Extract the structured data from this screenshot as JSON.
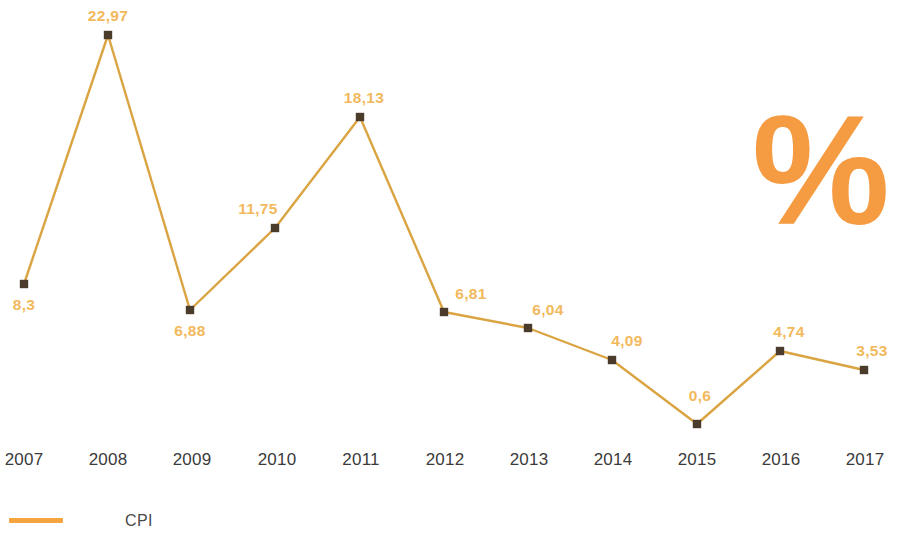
{
  "chart_data": {
    "type": "line",
    "title": "",
    "subtitle": "",
    "xlabel": "",
    "ylabel": "",
    "unit_symbol": "%",
    "grid": false,
    "legend_position": "bottom-left",
    "axis_line": false,
    "categories": [
      "2007",
      "2008",
      "2009",
      "2010",
      "2011",
      "2012",
      "2013",
      "2014",
      "2015",
      "2016",
      "2017"
    ],
    "values": [
      8.3,
      22.97,
      6.88,
      11.75,
      18.13,
      6.81,
      6.04,
      4.09,
      0.6,
      4.74,
      3.53
    ],
    "value_labels": [
      "8,3",
      "22,97",
      "6,88",
      "11,75",
      "18,13",
      "6,81",
      "6,04",
      "4,09",
      "0,6",
      "4,74",
      "3,53"
    ],
    "ylim": [
      0,
      24
    ],
    "series": [
      {
        "name": "CPI",
        "values": [
          8.3,
          22.97,
          6.88,
          11.75,
          18.13,
          6.81,
          6.04,
          4.09,
          0.6,
          4.74,
          3.53
        ],
        "color": "#D9A441"
      }
    ],
    "points": [
      {
        "year": "2007",
        "label": "8,3",
        "value": 8.3,
        "x": 24,
        "y": 284,
        "label_x": 24,
        "label_y": 297,
        "label_align": "center"
      },
      {
        "year": "2008",
        "label": "22,97",
        "value": 22.97,
        "x": 108,
        "y": 35,
        "label_x": 108,
        "label_y": 8,
        "label_align": "center"
      },
      {
        "year": "2009",
        "label": "6,88",
        "value": 6.88,
        "x": 190,
        "y": 310,
        "label_x": 190,
        "label_y": 323,
        "label_align": "center"
      },
      {
        "year": "2010",
        "label": "11,75",
        "value": 11.75,
        "x": 275,
        "y": 228,
        "label_x": 258,
        "label_y": 201,
        "label_align": "center"
      },
      {
        "year": "2011",
        "label": "18,13",
        "value": 18.13,
        "x": 360,
        "y": 117,
        "label_x": 364,
        "label_y": 90,
        "label_align": "center"
      },
      {
        "year": "2012",
        "label": "6,81",
        "value": 6.81,
        "x": 444,
        "y": 312,
        "label_x": 471,
        "label_y": 286,
        "label_align": "center"
      },
      {
        "year": "2013",
        "label": "6,04",
        "value": 6.04,
        "x": 528,
        "y": 328,
        "label_x": 548,
        "label_y": 302,
        "label_align": "center"
      },
      {
        "year": "2014",
        "label": "4,09",
        "value": 4.09,
        "x": 612,
        "y": 360,
        "label_x": 627,
        "label_y": 333,
        "label_align": "center"
      },
      {
        "year": "2015",
        "label": "0,6",
        "value": 0.6,
        "x": 697,
        "y": 424,
        "label_x": 700,
        "label_y": 388,
        "label_align": "center"
      },
      {
        "year": "2016",
        "label": "4,74",
        "value": 4.74,
        "x": 780,
        "y": 351,
        "label_x": 789,
        "label_y": 324,
        "label_align": "center"
      },
      {
        "year": "2017",
        "label": "3,53",
        "value": 3.53,
        "x": 864,
        "y": 370,
        "label_x": 872,
        "label_y": 343,
        "label_align": "center"
      }
    ],
    "year_label_positions": [
      24,
      108,
      192,
      277,
      361,
      445,
      529,
      613,
      697,
      781,
      865
    ],
    "legend": [
      {
        "name": "CPI",
        "color": "#F5A540"
      }
    ],
    "colors": {
      "line": "#D9A441",
      "marker": "#4A3B2A",
      "value_label": "#F2B95C",
      "year_label": "#3B3B3B",
      "legend_line": "#F5A540",
      "percent_symbol": "#F59B42",
      "background": "#FFFFFF"
    }
  }
}
